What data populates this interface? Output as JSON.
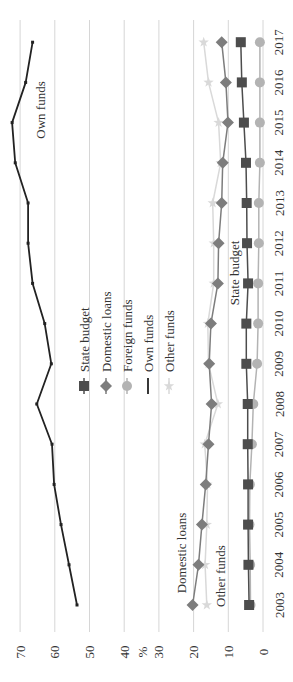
{
  "chart_data": {
    "type": "line",
    "orientation": "rotated-90-ccw",
    "title": "",
    "xlabel": "",
    "ylabel": "%",
    "ylim": [
      0,
      70
    ],
    "yticks": [
      0,
      10,
      20,
      30,
      40,
      50,
      60,
      70
    ],
    "grid": true,
    "categories": [
      "2003",
      "2004",
      "2005",
      "2006",
      "2007",
      "2008",
      "2009",
      "2010",
      "2011",
      "2012",
      "2013",
      "2014",
      "2015",
      "2016",
      "2017"
    ],
    "series": [
      {
        "name": "State budget",
        "color": "#4d4d4d",
        "marker": "square",
        "values": [
          4.0,
          4.2,
          4.3,
          4.3,
          4.4,
          4.4,
          4.8,
          4.8,
          4.3,
          4.6,
          4.7,
          4.9,
          5.5,
          6.1,
          6.4
        ]
      },
      {
        "name": "Domestic loans",
        "color": "#7d7d7d",
        "marker": "diamond",
        "values": [
          20.3,
          18.6,
          17.6,
          16.5,
          15.7,
          14.8,
          15.5,
          15.0,
          13.0,
          12.8,
          11.9,
          11.6,
          10.1,
          10.7,
          11.9
        ]
      },
      {
        "name": "Foreign funds",
        "color": "#b3b3b3",
        "marker": "circle",
        "values": [
          3.6,
          3.7,
          3.9,
          3.8,
          3.2,
          2.8,
          1.7,
          1.4,
          1.4,
          1.2,
          1.2,
          0.9,
          0.9,
          0.9,
          0.9
        ]
      },
      {
        "name": "Own funds",
        "color": "#222222",
        "marker": "none",
        "values": [
          53.6,
          55.9,
          58.2,
          60.2,
          60.8,
          65.2,
          61.0,
          62.9,
          66.4,
          67.7,
          67.7,
          71.4,
          72.3,
          68.4,
          66.4
        ]
      },
      {
        "name": "Other funds",
        "color": "#d9d9d9",
        "marker": "star",
        "values": [
          16.2,
          16.7,
          16.2,
          16.0,
          16.8,
          13.0,
          15.7,
          15.9,
          14.2,
          14.2,
          14.5,
          12.2,
          12.8,
          15.7,
          17.1
        ]
      }
    ],
    "legend": {
      "position": "inside-middle",
      "entries": [
        "State budget",
        "Domestic loans",
        "Foreign funds",
        "Own funds",
        "Other funds"
      ]
    },
    "annotations": [
      {
        "text": "Own funds",
        "series": "Own funds"
      },
      {
        "text": "State budget",
        "series": "State budget"
      },
      {
        "text": "Domestic loans",
        "series": "Domestic loans"
      },
      {
        "text": "Other funds",
        "series": "Other funds"
      }
    ]
  }
}
